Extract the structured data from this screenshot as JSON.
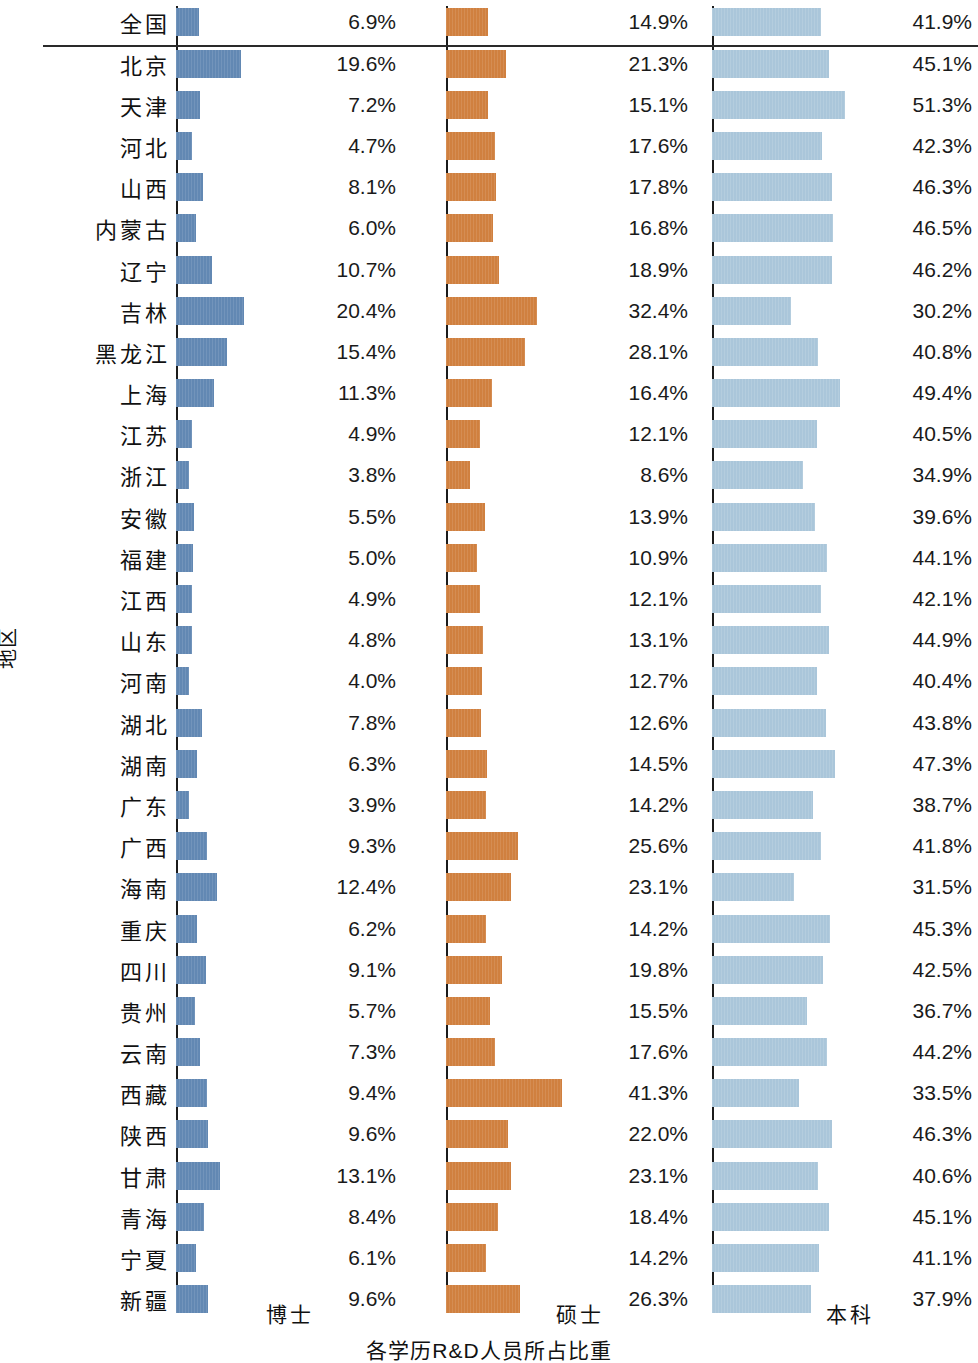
{
  "axis": {
    "y_title": "地区",
    "x_title": "各学历R&D人员所占比重"
  },
  "panels": [
    {
      "key": "doctor",
      "label": "博士"
    },
    {
      "key": "master",
      "label": "硕士"
    },
    {
      "key": "bachelor",
      "label": "本科"
    }
  ],
  "colors": {
    "doctor": "#6288b3",
    "master": "#d0803f",
    "bachelor": "#aac6da",
    "axis": "#1b1b1b",
    "text": "#1a1a1a",
    "background": "#ffffff"
  },
  "chart_data": {
    "type": "bar",
    "title": "",
    "subtitle": "",
    "xlabel": "各学历R&D人员所占比重",
    "ylabel": "地区",
    "orientation": "horizontal",
    "layout": "small-multiples, three side-by-side panels sharing one category axis",
    "grid": false,
    "legend": "none (panel captions used instead)",
    "value_labels": true,
    "value_format": "percent, one decimal",
    "separator_after_category": "全国",
    "panel_xlim": [
      0,
      55
    ],
    "categories": [
      "全国",
      "北京",
      "天津",
      "河北",
      "山西",
      "内蒙古",
      "辽宁",
      "吉林",
      "黑龙江",
      "上海",
      "江苏",
      "浙江",
      "安徽",
      "福建",
      "江西",
      "山东",
      "河南",
      "湖北",
      "湖南",
      "广东",
      "广西",
      "海南",
      "重庆",
      "四川",
      "贵州",
      "云南",
      "西藏",
      "陕西",
      "甘肃",
      "青海",
      "宁夏",
      "新疆"
    ],
    "series": [
      {
        "name": "博士",
        "key": "doctor",
        "color": "#6288b3",
        "values": [
          6.9,
          19.6,
          7.2,
          4.7,
          8.1,
          6.0,
          10.7,
          20.4,
          15.4,
          11.3,
          4.9,
          3.8,
          5.5,
          5.0,
          4.9,
          4.8,
          4.0,
          7.8,
          6.3,
          3.9,
          9.3,
          12.4,
          6.2,
          9.1,
          5.7,
          7.3,
          9.4,
          9.6,
          13.1,
          8.4,
          6.1,
          9.6
        ],
        "labels": [
          "6.9%",
          "19.6%",
          "7.2%",
          "4.7%",
          "8.1%",
          "6.0%",
          "10.7%",
          "20.4%",
          "15.4%",
          "11.3%",
          "4.9%",
          "3.8%",
          "5.5%",
          "5.0%",
          "4.9%",
          "4.8%",
          "4.0%",
          "7.8%",
          "6.3%",
          "3.9%",
          "9.3%",
          "12.4%",
          "6.2%",
          "9.1%",
          "5.7%",
          "7.3%",
          "9.4%",
          "9.6%",
          "13.1%",
          "8.4%",
          "6.1%",
          "9.6%"
        ]
      },
      {
        "name": "硕士",
        "key": "master",
        "color": "#d0803f",
        "values": [
          14.9,
          21.3,
          15.1,
          17.6,
          17.8,
          16.8,
          18.9,
          32.4,
          28.1,
          16.4,
          12.1,
          8.6,
          13.9,
          10.9,
          12.1,
          13.1,
          12.7,
          12.6,
          14.5,
          14.2,
          25.6,
          23.1,
          14.2,
          19.8,
          15.5,
          17.6,
          41.3,
          22.0,
          23.1,
          18.4,
          14.2,
          26.3
        ],
        "labels": [
          "14.9%",
          "21.3%",
          "15.1%",
          "17.6%",
          "17.8%",
          "16.8%",
          "18.9%",
          "32.4%",
          "28.1%",
          "16.4%",
          "12.1%",
          "8.6%",
          "13.9%",
          "10.9%",
          "12.1%",
          "13.1%",
          "12.7%",
          "12.6%",
          "14.5%",
          "14.2%",
          "25.6%",
          "23.1%",
          "14.2%",
          "19.8%",
          "15.5%",
          "17.6%",
          "41.3%",
          "22.0%",
          "23.1%",
          "18.4%",
          "14.2%",
          "26.3%"
        ]
      },
      {
        "name": "本科",
        "key": "bachelor",
        "color": "#aac6da",
        "values": [
          41.9,
          45.1,
          51.3,
          42.3,
          46.3,
          46.5,
          46.2,
          30.2,
          40.8,
          49.4,
          40.5,
          34.9,
          39.6,
          44.1,
          42.1,
          44.9,
          40.4,
          43.8,
          47.3,
          38.7,
          41.8,
          31.5,
          45.3,
          42.5,
          36.7,
          44.2,
          33.5,
          46.3,
          40.6,
          45.1,
          41.1,
          37.9
        ],
        "labels": [
          "41.9%",
          "45.1%",
          "51.3%",
          "42.3%",
          "46.3%",
          "46.5%",
          "46.2%",
          "30.2%",
          "40.8%",
          "49.4%",
          "40.5%",
          "34.9%",
          "39.6%",
          "44.1%",
          "42.1%",
          "44.9%",
          "40.4%",
          "43.8%",
          "47.3%",
          "38.7%",
          "41.8%",
          "31.5%",
          "45.3%",
          "42.5%",
          "36.7%",
          "44.2%",
          "33.5%",
          "46.3%",
          "40.6%",
          "45.1%",
          "41.1%",
          "37.9%"
        ]
      }
    ]
  }
}
